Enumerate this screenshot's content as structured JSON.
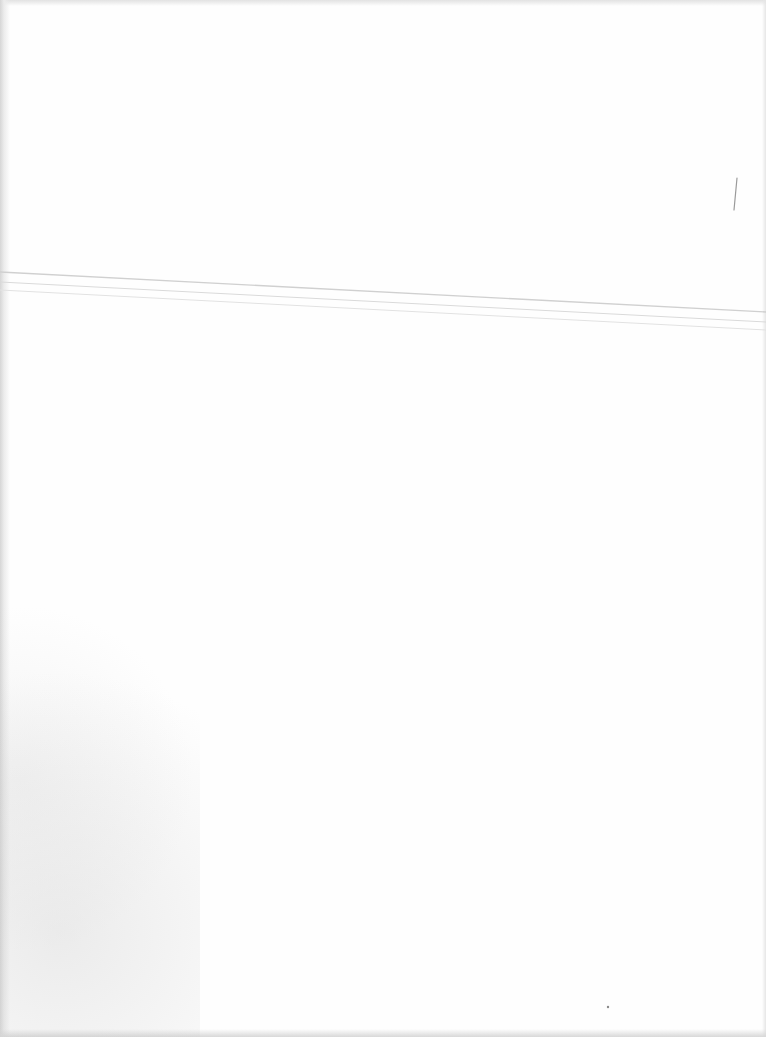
{
  "page": {
    "background": "#fefefe",
    "text_content": [],
    "artifacts": {
      "fold_lines": [
        {
          "x1": 0,
          "y1": 272,
          "x2": 766,
          "y2": 312,
          "color": "#d0d0d0"
        },
        {
          "x1": 0,
          "y1": 282,
          "x2": 766,
          "y2": 322,
          "color": "#dadada"
        },
        {
          "x1": 0,
          "y1": 290,
          "x2": 766,
          "y2": 330,
          "color": "#e2e2e2"
        }
      ],
      "scratch": {
        "x1": 737,
        "y1": 178,
        "x2": 734,
        "y2": 210,
        "color": "#9a9a9a"
      },
      "speck": {
        "x": 608,
        "y": 1007,
        "color": "#8a8a8a"
      }
    }
  }
}
